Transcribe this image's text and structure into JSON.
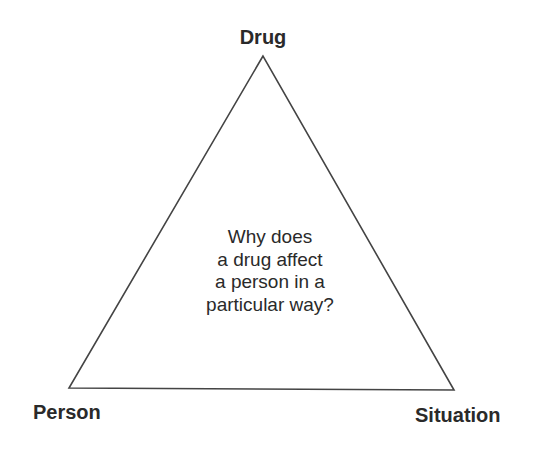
{
  "diagram": {
    "type": "triangle",
    "vertices": {
      "top": {
        "label": "Drug"
      },
      "bottom_left": {
        "label": "Person"
      },
      "bottom_right": {
        "label": "Situation"
      }
    },
    "center_question": {
      "lines": [
        "Why does",
        "a drug affect",
        "a person in a",
        "particular way?"
      ]
    },
    "colors": {
      "line": "#444444",
      "text": "#2a2a2a",
      "background": "#ffffff"
    }
  }
}
